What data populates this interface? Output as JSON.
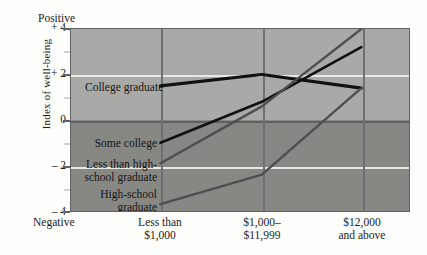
{
  "chart_data": {
    "type": "line",
    "title": "",
    "xlabel": "",
    "ylabel": "Index of well-being",
    "axis_top_caption": "Positive",
    "axis_bottom_caption": "Negative",
    "categories": [
      "Less than\n$1,000",
      "$1,000-\n$11,999",
      "$12,000\nand above"
    ],
    "category_lines": [
      [
        "Less than",
        "$1,000"
      ],
      [
        "$1,000–",
        "$11,999"
      ],
      [
        "$12,000",
        "and above"
      ]
    ],
    "ylim": [
      -4,
      4
    ],
    "yticks": [
      4,
      2,
      0,
      -2,
      -4
    ],
    "ytick_labels": [
      "+ 4",
      "+ 2",
      "0",
      "– 2",
      "– 4"
    ],
    "yminor_ticks": [
      3,
      1,
      -1,
      -3
    ],
    "grid": "horizontal-at-+2-and--2, vertical-at-categories",
    "legend": "inline-labels",
    "series": [
      {
        "name": "College graduate",
        "color": "#111111",
        "width": 3.2,
        "values": [
          1.5,
          2.0,
          1.4
        ]
      },
      {
        "name": "Some college",
        "color": "#111111",
        "width": 2.6,
        "values": [
          -1.0,
          0.8,
          3.2
        ]
      },
      {
        "name": "Less than high-school graduate",
        "color": "#4c4e50",
        "width": 2.4,
        "values": [
          -1.9,
          0.6,
          4.0
        ]
      },
      {
        "name": "High-school graduate",
        "color": "#4c4e50",
        "width": 2.4,
        "values": [
          -3.7,
          -2.4,
          1.4
        ]
      }
    ]
  },
  "series_labels": [
    {
      "text": "College graduate",
      "key": "college-graduate"
    },
    {
      "text": "Some college",
      "key": "some-college"
    },
    {
      "text": "Less than high-",
      "key": "less-than-high-school-line1"
    },
    {
      "text": "school graduate",
      "key": "less-than-high-school-line2"
    },
    {
      "text": "High-school",
      "key": "high-school-graduate-line1"
    },
    {
      "text": "graduate",
      "key": "high-school-graduate-line2"
    }
  ],
  "colors": {
    "band_positive": "#a9aaa7",
    "band_negative": "#878884",
    "gridline": "#e9e9e4",
    "axis": "#5f6163",
    "series_dark": "#111111",
    "series_gray": "#4c4e50",
    "page_background": "#fefefc"
  }
}
